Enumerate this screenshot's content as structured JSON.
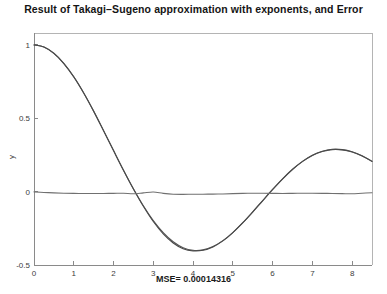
{
  "chart_data": {
    "type": "line",
    "title": "Result of Takagi–Sugeno approximation with exponents, and Error",
    "xlabel": "MSE= 0.00014316",
    "ylabel": "y",
    "xlim": [
      0,
      8.5
    ],
    "ylim": [
      -0.5,
      1.08
    ],
    "grid": false,
    "legend": false,
    "xticks": [
      0,
      1,
      2,
      3,
      4,
      5,
      6,
      7,
      8
    ],
    "xticklabels": [
      "0",
      "1",
      "2",
      "3",
      "4",
      "5",
      "6",
      "7",
      "8"
    ],
    "yticks": [
      -0.5,
      0,
      0.5,
      1
    ],
    "yticklabels": [
      "-0.5",
      "0",
      "0.5",
      "1"
    ],
    "series": [
      {
        "name": "target-function",
        "color": "#555555",
        "x": [
          0,
          0.25,
          0.5,
          0.75,
          1,
          1.25,
          1.5,
          1.75,
          2,
          2.25,
          2.5,
          2.75,
          3,
          3.25,
          3.5,
          3.75,
          4,
          4.25,
          4.5,
          4.75,
          5,
          5.25,
          5.5,
          5.75,
          6,
          6.25,
          6.5,
          6.75,
          7,
          7.25,
          7.5,
          7.75,
          8,
          8.25,
          8.5
        ],
        "y": [
          1.0,
          0.985,
          0.942,
          0.873,
          0.782,
          0.672,
          0.548,
          0.415,
          0.28,
          0.146,
          0.019,
          -0.097,
          -0.198,
          -0.28,
          -0.342,
          -0.382,
          -0.4,
          -0.397,
          -0.374,
          -0.334,
          -0.279,
          -0.213,
          -0.14,
          -0.063,
          0.013,
          0.085,
          0.15,
          0.204,
          0.246,
          0.273,
          0.286,
          0.284,
          0.269,
          0.242,
          0.205
        ]
      },
      {
        "name": "takagi-sugeno-approximation",
        "color": "#4a4a4a",
        "x": [
          0,
          0.25,
          0.5,
          0.75,
          1,
          1.25,
          1.5,
          1.75,
          2,
          2.25,
          2.5,
          2.75,
          3,
          3.25,
          3.5,
          3.75,
          4,
          4.25,
          4.5,
          4.75,
          5,
          5.25,
          5.5,
          5.75,
          6,
          6.25,
          6.5,
          6.75,
          7,
          7.25,
          7.5,
          7.75,
          8,
          8.25,
          8.5
        ],
        "y": [
          0.998,
          0.984,
          0.941,
          0.872,
          0.781,
          0.671,
          0.547,
          0.414,
          0.279,
          0.145,
          0.018,
          -0.1,
          -0.204,
          -0.288,
          -0.35,
          -0.389,
          -0.404,
          -0.4,
          -0.377,
          -0.336,
          -0.279,
          -0.212,
          -0.138,
          -0.061,
          0.015,
          0.087,
          0.152,
          0.206,
          0.248,
          0.275,
          0.288,
          0.286,
          0.271,
          0.244,
          0.207
        ]
      },
      {
        "name": "approximation-error",
        "color": "#707070",
        "x": [
          0,
          0.25,
          0.5,
          0.75,
          1,
          1.25,
          1.5,
          1.75,
          2,
          2.25,
          2.5,
          2.75,
          3,
          3.25,
          3.5,
          3.75,
          4,
          4.25,
          4.5,
          4.75,
          5,
          5.25,
          5.5,
          5.75,
          6,
          6.25,
          6.5,
          6.75,
          7,
          7.25,
          7.5,
          7.75,
          8,
          8.25,
          8.5
        ],
        "y": [
          -0.002,
          -0.006,
          -0.009,
          -0.011,
          -0.012,
          -0.013,
          -0.013,
          -0.013,
          -0.012,
          -0.011,
          -0.015,
          -0.009,
          -0.003,
          -0.012,
          -0.018,
          -0.019,
          -0.018,
          -0.018,
          -0.017,
          -0.016,
          -0.014,
          -0.012,
          -0.011,
          -0.011,
          -0.012,
          -0.013,
          -0.012,
          -0.011,
          -0.011,
          -0.012,
          -0.013,
          -0.014,
          -0.015,
          -0.011,
          -0.008
        ]
      }
    ]
  },
  "axes": {
    "y_axis_title": "y"
  }
}
